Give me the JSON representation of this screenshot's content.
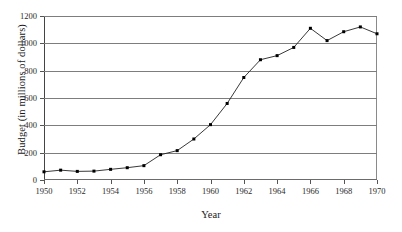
{
  "chart_data": {
    "type": "line",
    "title": "",
    "xlabel": "Year",
    "ylabel": "Budget (in millions of dollars)",
    "xlim": [
      1950,
      1970
    ],
    "ylim": [
      0,
      1200
    ],
    "grid": true,
    "legend": "none",
    "marker": "square",
    "x": [
      1950,
      1951,
      1952,
      1953,
      1954,
      1955,
      1956,
      1957,
      1958,
      1959,
      1960,
      1961,
      1962,
      1963,
      1964,
      1965,
      1966,
      1967,
      1968,
      1969,
      1970
    ],
    "values": [
      60,
      72,
      63,
      65,
      78,
      90,
      105,
      185,
      215,
      300,
      405,
      560,
      750,
      880,
      910,
      970,
      1110,
      1020,
      1085,
      1120,
      1070
    ],
    "xticks": [
      1950,
      1952,
      1954,
      1956,
      1958,
      1960,
      1962,
      1964,
      1966,
      1968,
      1970
    ],
    "xtick_labels": [
      "1950",
      "1952",
      "1954",
      "1956",
      "1958",
      "1960",
      "1962",
      "1964",
      "1966",
      "1968",
      "1970"
    ],
    "yticks": [
      0,
      200,
      400,
      600,
      800,
      1000,
      1200
    ],
    "ytick_labels": [
      "0",
      "200",
      "400",
      "600",
      "800",
      "1000",
      "1200"
    ],
    "series_name": "Budget",
    "line_color": "#222222",
    "marker_color": "#000000",
    "grid_color": "#7d7d7d",
    "background_color": "#ffffff"
  }
}
